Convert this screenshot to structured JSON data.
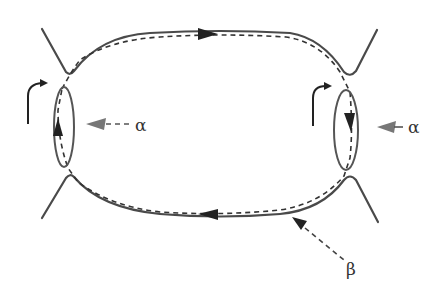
{
  "diagram": {
    "type": "phase-space orbit schematic",
    "colors": {
      "solid_line": "#4a4a4a",
      "dashed_line": "#333333",
      "arrowhead": "#222222",
      "label_arrow": "#777777",
      "label_text": "#333333",
      "background": "#ffffff"
    },
    "labels": {
      "alpha_left": "α",
      "alpha_right": "α",
      "beta": "β"
    },
    "elements": [
      {
        "name": "upper-separatrix",
        "style": "solid",
        "description": "top boundary curve with V-shaped dips at both ends"
      },
      {
        "name": "lower-separatrix",
        "style": "solid",
        "description": "bottom boundary curve with inverted-V peaks at both ends"
      },
      {
        "name": "left-ellipse",
        "style": "solid",
        "label": "α"
      },
      {
        "name": "right-ellipse",
        "style": "solid",
        "label": "α"
      },
      {
        "name": "dashed-orbit",
        "style": "dashed",
        "description": "closed orbit running clockwise: right along top, down through right ellipse, left along bottom, up through left ellipse",
        "label": "β"
      },
      {
        "name": "curved-arrow-left",
        "style": "solid"
      },
      {
        "name": "curved-arrow-right",
        "style": "solid"
      }
    ]
  }
}
